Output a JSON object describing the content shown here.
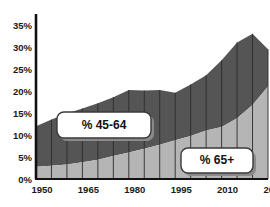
{
  "title_remnant": "",
  "axes": {
    "y_ticks": [
      "0%",
      "5%",
      "10%",
      "15%",
      "20%",
      "25%",
      "30%",
      "35%"
    ],
    "x_ticks": [
      "1950",
      "1965",
      "1980",
      "1995",
      "2010",
      "2025"
    ]
  },
  "callouts": {
    "upper": "% 45-64",
    "lower": "% 65+"
  },
  "colors": {
    "band_45_64": "#555555",
    "band_65_plus": "#b5b5b5",
    "axis": "#111111",
    "callout_fill": "#ffffff",
    "callout_border": "#3a3a3a",
    "callout_shadow": "#8a8a8a"
  },
  "chart_data": {
    "type": "area",
    "title": "",
    "subtitle": "",
    "xlabel": "",
    "ylabel": "",
    "stacked": true,
    "grid": false,
    "legend": "callouts-on-plot",
    "ylim": [
      0,
      37
    ],
    "xlim": [
      1950,
      2025
    ],
    "x": [
      1950,
      1955,
      1960,
      1965,
      1970,
      1975,
      1980,
      1985,
      1990,
      1995,
      2000,
      2005,
      2010,
      2015,
      2020,
      2025
    ],
    "categories": [
      "1950",
      "1955",
      "1960",
      "1965",
      "1970",
      "1975",
      "1980",
      "1985",
      "1990",
      "1995",
      "2000",
      "2005",
      "2010",
      "2015",
      "2020",
      "2025"
    ],
    "series": [
      {
        "name": "% 65+",
        "color": "#b5b5b5",
        "values": [
          2.8,
          3.0,
          3.3,
          3.8,
          4.4,
          5.2,
          6.0,
          6.9,
          7.8,
          8.8,
          9.8,
          11.0,
          11.8,
          13.8,
          16.8,
          21.0
        ]
      },
      {
        "name": "% 45-64",
        "color": "#555555",
        "values": [
          9.2,
          10.5,
          11.6,
          12.2,
          12.8,
          13.4,
          14.2,
          13.2,
          12.4,
          10.8,
          11.7,
          12.6,
          15.2,
          17.2,
          16.2,
          8.5
        ]
      }
    ],
    "totals": [
      12.0,
      13.5,
      14.9,
      16.0,
      17.2,
      18.6,
      20.2,
      20.1,
      20.2,
      19.6,
      21.5,
      23.6,
      27.0,
      31.0,
      33.0,
      29.5
    ],
    "annotations": [
      {
        "text": "% 45-64",
        "series": "% 45-64"
      },
      {
        "text": "% 65+",
        "series": "% 65+"
      }
    ]
  }
}
